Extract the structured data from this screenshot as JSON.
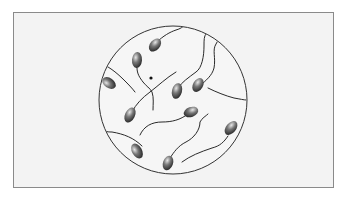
{
  "figure": {
    "frame_color": "#8a8a8a",
    "background_color": "#f3f3f3",
    "circle": {
      "cx": 173,
      "cy": 100,
      "r": 74,
      "stroke": "#333333"
    },
    "cell_count": 10,
    "cell_head_color": "#4a4a4a",
    "tail_color": "#2a2a2a"
  }
}
